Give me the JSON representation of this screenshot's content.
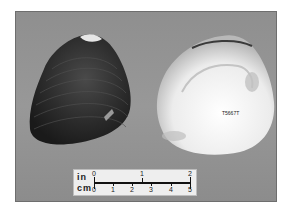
{
  "image": {
    "description": "Two valves of a freshwater mussel shell on gray background: dark exterior (left) and pearly white interior (right), with a scale bar",
    "background_color": "#939393",
    "border_color": "#ffffff"
  },
  "specimens": [
    {
      "name": "shell-exterior",
      "side": "left",
      "color": "#2a2a2a"
    },
    {
      "name": "shell-interior",
      "side": "right",
      "color": "#f2f2f2",
      "label": "T5667T"
    }
  ],
  "scale_bar": {
    "units_top": "in",
    "units_bottom": "cm",
    "inch_labels": [
      "0",
      "1",
      "2"
    ],
    "cm_labels": [
      "0",
      "1",
      "2",
      "3",
      "4",
      "5"
    ]
  }
}
